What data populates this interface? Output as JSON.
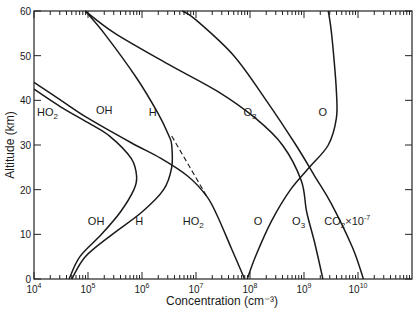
{
  "chart_data": {
    "type": "line",
    "title": "",
    "xlabel": "Concentration (cm⁻³)",
    "ylabel": "Altitude (km)",
    "xscale": "log",
    "xlim_exponent": [
      4,
      11
    ],
    "ylim": [
      0,
      60
    ],
    "x_ticks": [
      {
        "base": "10",
        "exp": "4",
        "value_exp": 4
      },
      {
        "base": "10",
        "exp": "5",
        "value_exp": 5
      },
      {
        "base": "10",
        "exp": "6",
        "value_exp": 6
      },
      {
        "base": "10",
        "exp": "7",
        "value_exp": 7
      },
      {
        "base": "10",
        "exp": "8",
        "value_exp": 8
      },
      {
        "base": "10",
        "exp": "9",
        "value_exp": 9
      },
      {
        "base": "10",
        "exp": "10",
        "value_exp": 10
      }
    ],
    "y_ticks": [
      0,
      10,
      20,
      30,
      40,
      50,
      60
    ],
    "grid": false,
    "series": [
      {
        "name": "OH",
        "points": [
          [
            4.65,
            0
          ],
          [
            4.85,
            5
          ],
          [
            5.25,
            10
          ],
          [
            5.6,
            15
          ],
          [
            5.85,
            20
          ],
          [
            5.9,
            23
          ],
          [
            5.8,
            27
          ],
          [
            5.4,
            32
          ],
          [
            5.0,
            35
          ],
          [
            4.5,
            38.5
          ],
          [
            4.0,
            42.5
          ]
        ]
      },
      {
        "name": "H",
        "points": [
          [
            4.7,
            0
          ],
          [
            4.95,
            5
          ],
          [
            5.45,
            10
          ],
          [
            6.0,
            15
          ],
          [
            6.4,
            20
          ],
          [
            6.55,
            25
          ],
          [
            6.55,
            30
          ],
          [
            6.5,
            32
          ],
          [
            6.3,
            37
          ],
          [
            5.9,
            45
          ],
          [
            5.3,
            55
          ],
          [
            4.95,
            60
          ]
        ]
      },
      {
        "name": "HO2",
        "points": [
          [
            7.9,
            0
          ],
          [
            7.65,
            7
          ],
          [
            7.4,
            14
          ],
          [
            7.2,
            18.5
          ],
          [
            6.85,
            23
          ],
          [
            6.35,
            27
          ],
          [
            5.8,
            30.5
          ],
          [
            5.0,
            36
          ],
          [
            4.5,
            40
          ],
          [
            4.0,
            44
          ]
        ]
      },
      {
        "name": "O3",
        "points": [
          [
            9.35,
            0
          ],
          [
            9.2,
            8
          ],
          [
            9.05,
            15
          ],
          [
            8.95,
            22
          ],
          [
            8.6,
            30
          ],
          [
            8.1,
            36
          ],
          [
            7.4,
            42
          ],
          [
            6.5,
            48
          ],
          [
            5.5,
            55
          ],
          [
            4.95,
            60
          ]
        ]
      },
      {
        "name": "O",
        "points": [
          [
            7.95,
            0
          ],
          [
            8.1,
            5
          ],
          [
            8.4,
            13
          ],
          [
            8.75,
            20
          ],
          [
            9.1,
            25
          ],
          [
            9.45,
            30
          ],
          [
            9.6,
            36
          ],
          [
            9.6,
            42
          ],
          [
            9.55,
            50
          ],
          [
            9.5,
            56
          ],
          [
            9.45,
            60
          ]
        ]
      },
      {
        "name": "CO2 x 10^-7",
        "points": [
          [
            10.1,
            0
          ],
          [
            9.9,
            7
          ],
          [
            9.5,
            17
          ],
          [
            9.2,
            23
          ],
          [
            8.85,
            30
          ],
          [
            8.3,
            40
          ],
          [
            7.7,
            50
          ],
          [
            7.0,
            58
          ],
          [
            6.75,
            60
          ]
        ]
      }
    ],
    "dashed_segment": {
      "from": [
        6.55,
        32
      ],
      "to": [
        7.2,
        18.5
      ]
    },
    "curve_labels": [
      {
        "text": "HO",
        "sub": "2",
        "x_exp": 4.25,
        "y": 36.5
      },
      {
        "text": "OH",
        "sub": "",
        "x_exp": 5.3,
        "y": 37
      },
      {
        "text": "H",
        "sub": "",
        "x_exp": 6.2,
        "y": 36.5
      },
      {
        "text": "O",
        "sub": "3",
        "x_exp": 8.0,
        "y": 36.5
      },
      {
        "text": "O",
        "sub": "",
        "x_exp": 9.35,
        "y": 36.5
      },
      {
        "text": "OH",
        "sub": "",
        "x_exp": 5.15,
        "y": 12
      },
      {
        "text": "H",
        "sub": "",
        "x_exp": 5.95,
        "y": 12
      },
      {
        "text": "HO",
        "sub": "2",
        "x_exp": 6.95,
        "y": 12
      },
      {
        "text": "O",
        "sub": "",
        "x_exp": 8.15,
        "y": 12
      },
      {
        "text": "O",
        "sub": "3",
        "x_exp": 8.9,
        "y": 12
      },
      {
        "text": "CO",
        "sub": "2",
        "sup": "-7",
        "mult": "×10",
        "x_exp": 9.8,
        "y": 12
      }
    ]
  }
}
